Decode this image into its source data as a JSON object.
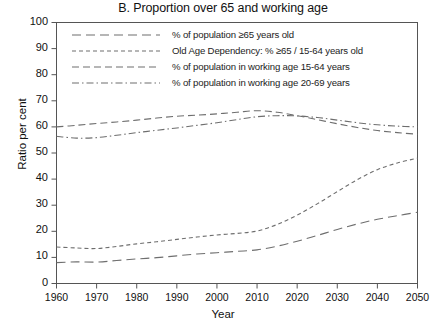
{
  "chart_data": {
    "type": "line",
    "title": "B. Proportion over 65 and working age",
    "xlabel": "Year",
    "ylabel": "Ratio per cent",
    "xlim": [
      1960,
      2050
    ],
    "ylim": [
      0,
      100
    ],
    "grid": false,
    "legend_position": "top-left-inside",
    "xticks": [
      1960,
      1970,
      1980,
      1990,
      2000,
      2010,
      2020,
      2030,
      2040,
      2050
    ],
    "yticks": [
      0,
      10,
      20,
      30,
      40,
      50,
      60,
      70,
      80,
      90,
      100
    ],
    "x": [
      1960,
      1965,
      1970,
      1975,
      1980,
      1985,
      1990,
      1995,
      2000,
      2005,
      2010,
      2015,
      2020,
      2025,
      2030,
      2035,
      2040,
      2045,
      2050
    ],
    "series": [
      {
        "name": "% of population ≥65 years old",
        "dash": "long-dash",
        "values": [
          8.0,
          8.3,
          8.2,
          8.8,
          9.4,
          9.9,
          10.6,
          11.3,
          11.8,
          12.3,
          12.9,
          14.3,
          16.2,
          18.4,
          20.7,
          22.8,
          24.6,
          26.0,
          27.3
        ]
      },
      {
        "name": "Old Age Dependency: % ≥65 / 15-64 years old",
        "dash": "short-dash",
        "values": [
          14.0,
          13.6,
          13.4,
          14.2,
          15.2,
          16.0,
          16.9,
          17.8,
          18.6,
          19.2,
          20.1,
          22.6,
          26.2,
          30.5,
          35.2,
          39.8,
          43.6,
          46.2,
          48.0
        ]
      },
      {
        "name": "% of population in working age 15-64 years",
        "dash": "medium-dash",
        "values": [
          60.0,
          60.6,
          61.3,
          61.9,
          62.6,
          63.4,
          64.1,
          64.5,
          65.0,
          65.6,
          66.2,
          65.6,
          64.3,
          62.8,
          61.2,
          59.8,
          58.6,
          57.8,
          57.2
        ]
      },
      {
        "name": "% of population in working age 20-69 years",
        "dash": "dash-dot",
        "values": [
          56.4,
          55.7,
          55.9,
          56.8,
          57.8,
          58.7,
          59.6,
          60.6,
          61.6,
          62.8,
          63.9,
          64.3,
          64.2,
          63.6,
          62.6,
          61.6,
          60.8,
          60.3,
          60.0
        ]
      }
    ]
  },
  "legend": {
    "entries": [
      "% of population ≥65 years old",
      "Old Age Dependency: % ≥65 / 15-64 years old",
      "% of population in working age 15-64 years",
      "% of population in working age 20-69 years"
    ]
  },
  "style": {
    "line_color": "#6e6e6e",
    "axis_color": "#555555",
    "background": "#ffffff"
  }
}
